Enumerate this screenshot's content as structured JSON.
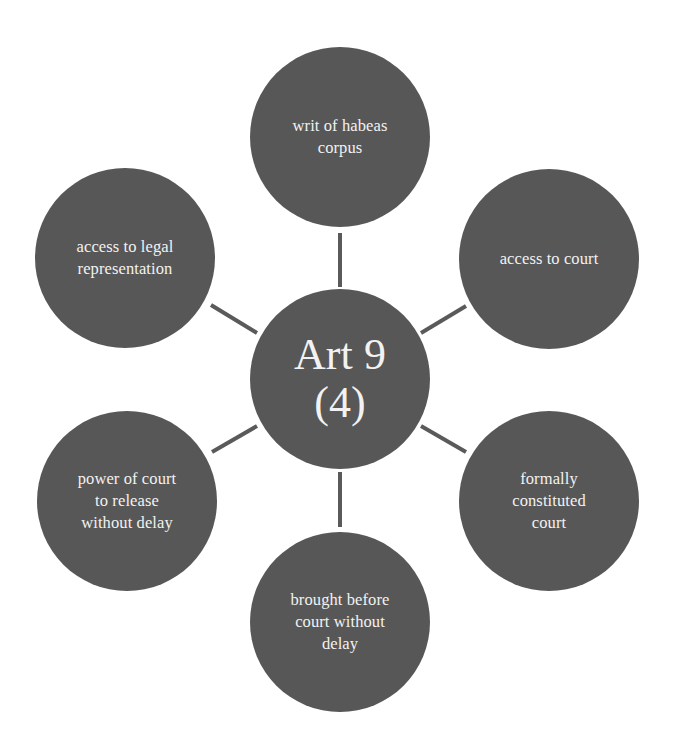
{
  "diagram": {
    "type": "hub-and-spoke",
    "center": {
      "label": "Art 9\n(4)",
      "cx": 340,
      "cy": 379
    },
    "nodes": [
      {
        "id": "top",
        "label": "writ of habeas\ncorpus",
        "cx": 340,
        "cy": 137
      },
      {
        "id": "upper-right",
        "label": "access to court",
        "cx": 549,
        "cy": 259
      },
      {
        "id": "lower-right",
        "label": "formally\nconstituted\ncourt",
        "cx": 549,
        "cy": 501
      },
      {
        "id": "bottom",
        "label": "brought before\ncourt without\ndelay",
        "cx": 340,
        "cy": 622
      },
      {
        "id": "lower-left",
        "label": "power of court\nto release\nwithout delay",
        "cx": 127,
        "cy": 501
      },
      {
        "id": "upper-left",
        "label": "access to legal\nrepresentation",
        "cx": 125,
        "cy": 258
      }
    ],
    "colors": {
      "node_fill": "#575757",
      "node_text": "#f2f2f2",
      "connector": "#5a5a5a",
      "background": "#ffffff"
    }
  }
}
